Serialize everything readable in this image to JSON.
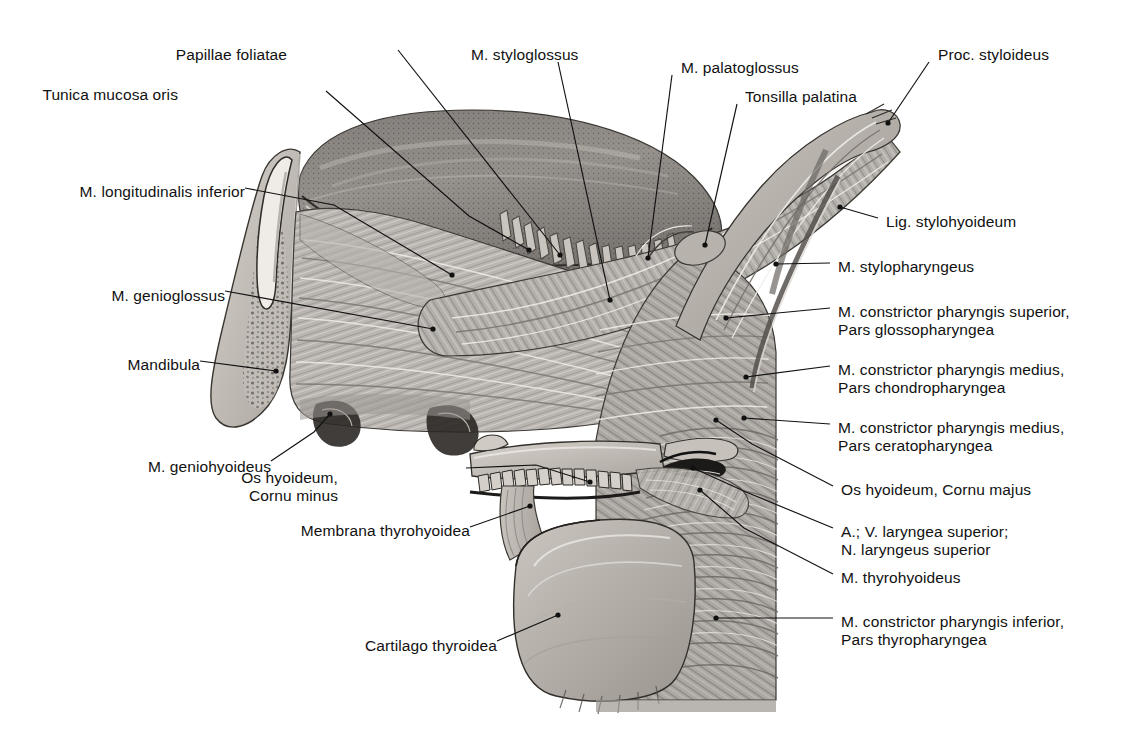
{
  "figure": {
    "kind": "anatomical-illustration",
    "background_color": "#ffffff",
    "ink_color": "#111111",
    "rendering": "grayscale halftone engraving"
  },
  "labels_left": [
    {
      "id": "papillae-foliatae",
      "text": "Papillae foliatae",
      "x": 287,
      "y": 55,
      "align": "right"
    },
    {
      "id": "tunica-mucosa-oris",
      "text": "Tunica mucosa oris",
      "x": 178,
      "y": 95,
      "align": "right"
    },
    {
      "id": "m-longitudinalis-inferior",
      "text": "M. longitudinalis inferior",
      "x": 78,
      "y": 192,
      "align": "right"
    },
    {
      "id": "m-genioglossus",
      "text": "M. genioglossus",
      "x": 100,
      "y": 296,
      "align": "right"
    },
    {
      "id": "mandibula",
      "text": "Mandibula",
      "x": 101,
      "y": 365,
      "align": "right"
    },
    {
      "id": "m-geniohyoideus",
      "text": "M. geniohyoideus",
      "x": 154,
      "y": 467,
      "align": "right"
    },
    {
      "id": "os-hyoideum-cornu-minus",
      "text": "Os hyoideum,\nCornu minus",
      "x": 338,
      "y": 478,
      "align": "right"
    },
    {
      "id": "membrana-thyrohyoidea",
      "text": "Membrana thyrohyoidea",
      "x": 286,
      "y": 531,
      "align": "right"
    },
    {
      "id": "cartilago-thyroidea",
      "text": "Cartilago thyroidea",
      "x": 340,
      "y": 646,
      "align": "right"
    }
  ],
  "labels_top": [
    {
      "id": "m-styloglossus",
      "text": "M. styloglossus",
      "x": 471,
      "y": 55,
      "align": "left"
    },
    {
      "id": "m-palatoglossus",
      "text": "M. palatoglossus",
      "x": 681,
      "y": 68,
      "align": "left"
    },
    {
      "id": "tonsilla-palatina",
      "text": "Tonsilla palatina",
      "x": 745,
      "y": 97,
      "align": "left"
    },
    {
      "id": "proc-styloideus",
      "text": "Proc. styloideus",
      "x": 938,
      "y": 55,
      "align": "left"
    }
  ],
  "labels_right": [
    {
      "id": "lig-stylohyoideum",
      "text": "Lig. stylohyoideum",
      "x": 886,
      "y": 222,
      "align": "left"
    },
    {
      "id": "m-stylopharyngeus",
      "text": "M. stylopharyngeus",
      "x": 838,
      "y": 267,
      "align": "left"
    },
    {
      "id": "m-constrictor-pharyngis-superior",
      "text": "M. constrictor pharyngis superior,\nPars glossopharyngea",
      "x": 838,
      "y": 312,
      "align": "left"
    },
    {
      "id": "m-constrictor-pharyngis-medius-chondro",
      "text": "M. constrictor pharyngis medius,\nPars chondropharyngea",
      "x": 838,
      "y": 370,
      "align": "left"
    },
    {
      "id": "m-constrictor-pharyngis-medius-cerato",
      "text": "M. constrictor pharyngis medius,\nPars ceratopharyngea",
      "x": 838,
      "y": 428,
      "align": "left"
    },
    {
      "id": "os-hyoideum-cornu-majus",
      "text": "Os hyoideum, Cornu majus",
      "x": 841,
      "y": 490,
      "align": "left"
    },
    {
      "id": "a-v-laryngea-superior",
      "text": "A.; V. laryngea superior;\nN. laryngeus superior",
      "x": 841,
      "y": 532,
      "align": "left"
    },
    {
      "id": "m-thyrohyoideus",
      "text": "M. thyrohyoideus",
      "x": 841,
      "y": 578,
      "align": "left"
    },
    {
      "id": "m-constrictor-pharyngis-inferior",
      "text": "M. constrictor pharyngis inferior,\nPars thyropharyngea",
      "x": 841,
      "y": 622,
      "align": "left"
    }
  ],
  "leaders": [
    {
      "for": "papillae-foliatae",
      "path": "M 398 50 L 560 255",
      "dot": [
        560,
        255
      ]
    },
    {
      "for": "tunica-mucosa-oris",
      "path": "M 326 91 L 469 216 L 529 250",
      "dot": [
        529,
        250
      ]
    },
    {
      "for": "m-longitudinalis-inferior",
      "path": "M 245 188 L 334 205 L 452 275",
      "dot": [
        452,
        275
      ]
    },
    {
      "for": "m-genioglossus",
      "path": "M 225 291 L 433 329",
      "dot": [
        433,
        329
      ]
    },
    {
      "for": "mandibula",
      "path": "M 200 361 L 276 371",
      "dot": [
        276,
        371
      ]
    },
    {
      "for": "m-geniohyoideus",
      "path": "M 271 461 L 314 432 L 330 414",
      "dot": [
        330,
        414
      ]
    },
    {
      "for": "os-hyoideum-cornu-minus",
      "path": "M 466 468 L 536 465 L 590 482",
      "dot": [
        590,
        482
      ]
    },
    {
      "for": "membrana-thyrohyoidea",
      "path": "M 470 527 L 530 506",
      "dot": [
        530,
        506
      ]
    },
    {
      "for": "cartilago-thyroidea",
      "path": "M 497 641 L 558 615",
      "dot": [
        558,
        615
      ]
    },
    {
      "for": "m-styloglossus",
      "path": "M 558 62 L 610 300",
      "dot": [
        610,
        300
      ]
    },
    {
      "for": "m-palatoglossus",
      "path": "M 672 75 L 648 258",
      "dot": [
        648,
        258
      ]
    },
    {
      "for": "tonsilla-palatina",
      "path": "M 737 104 L 705 245",
      "dot": [
        705,
        245
      ]
    },
    {
      "for": "proc-styloideus",
      "path": "M 929 62 L 888 123",
      "dot": [
        888,
        123
      ]
    },
    {
      "for": "lig-stylohyoideum",
      "path": "M 878 218 L 840 207",
      "dot": [
        840,
        207
      ]
    },
    {
      "for": "m-stylopharyngeus",
      "path": "M 830 263 L 776 264",
      "dot": [
        776,
        264
      ]
    },
    {
      "for": "m-constrictor-pharyngis-superior",
      "path": "M 830 308 L 726 318",
      "dot": [
        726,
        318
      ]
    },
    {
      "for": "m-constrictor-pharyngis-medius-chondro",
      "path": "M 830 366 L 746 377",
      "dot": [
        746,
        377
      ]
    },
    {
      "for": "m-constrictor-pharyngis-medius-cerato",
      "path": "M 830 424 L 744 418",
      "dot": [
        744,
        418
      ]
    },
    {
      "for": "os-hyoideum-cornu-majus",
      "path": "M 833 486 L 752 444 L 716 420",
      "dot": [
        716,
        420
      ]
    },
    {
      "for": "a-v-laryngea-superior",
      "path": "M 833 528 L 746 492 L 693 468",
      "dot": [
        693,
        468
      ]
    },
    {
      "for": "m-thyrohyoideus",
      "path": "M 833 574 L 744 528 L 700 490",
      "dot": [
        700,
        490
      ]
    },
    {
      "for": "m-constrictor-pharyngis-inferior",
      "path": "M 833 618 L 716 618",
      "dot": [
        716,
        618
      ]
    }
  ]
}
